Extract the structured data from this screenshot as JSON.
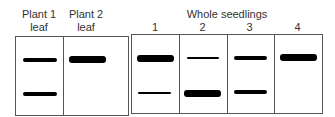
{
  "left_group": {
    "lanes": [
      {
        "label_line1": "Plant 1",
        "label_line2": "leaf"
      },
      {
        "label_line1": "Plant 2",
        "label_line2": "leaf"
      }
    ]
  },
  "right_group": {
    "title": "Whole seedlings",
    "lanes": [
      {
        "label": "1"
      },
      {
        "label": "2"
      },
      {
        "label": "3"
      },
      {
        "label": "4"
      }
    ]
  },
  "bands": {
    "plant1_leaf": [
      "upper-medium",
      "lower-medium"
    ],
    "plant2_leaf": [
      "upper-thick"
    ],
    "seedling_1": [
      "upper-thick",
      "lower-thin"
    ],
    "seedling_2": [
      "upper-thin",
      "lower-thick"
    ],
    "seedling_3": [
      "upper-medium",
      "lower-medium"
    ],
    "seedling_4": [
      "upper-thick"
    ]
  }
}
